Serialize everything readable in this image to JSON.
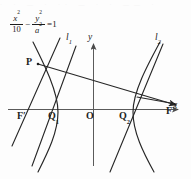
{
  "figure": {
    "equation": {
      "term1_num": "x",
      "term1_num_sup": "2",
      "term1_den": "10",
      "operator": "−",
      "term2_num": "y",
      "term2_num_sup": "2",
      "term2_den": "a",
      "term2_den_sup": "2",
      "equals": "=1",
      "plain": "x²/10 − y²/a² = 1"
    },
    "axes": {
      "x_label": "x",
      "y_label": "y",
      "origin_label": "O"
    },
    "points": [
      {
        "id": "P",
        "label": "P",
        "sub": "",
        "x": 38,
        "y": 64
      },
      {
        "id": "F1",
        "label": "F",
        "sub": "′",
        "x": 24,
        "y": 109
      },
      {
        "id": "Q1",
        "label": "Q",
        "sub": "1",
        "x": 55,
        "y": 109
      },
      {
        "id": "O",
        "label": "O",
        "sub": "",
        "x": 93,
        "y": 109
      },
      {
        "id": "Q2",
        "label": "Q",
        "sub": "2",
        "x": 126,
        "y": 109
      },
      {
        "id": "F",
        "label": "F",
        "sub": "",
        "x": 168,
        "y": 109
      }
    ],
    "lines": [
      {
        "id": "l1",
        "label": "l",
        "sub": "1"
      },
      {
        "id": "l2",
        "label": "l",
        "sub": "2"
      }
    ],
    "colors": {
      "stroke": "#262626",
      "axis": "#555555",
      "background": "#fdfdfd",
      "text": "#1c1c1c"
    }
  }
}
